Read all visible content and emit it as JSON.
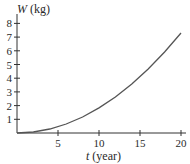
{
  "chart_data": {
    "type": "line",
    "title": "",
    "xlabel_var": "t",
    "xlabel_unit": "(year)",
    "ylabel_var": "W",
    "ylabel_unit": "(kg)",
    "x_ticks": [
      5,
      10,
      15,
      20
    ],
    "y_ticks": [
      1,
      2,
      3,
      4,
      5,
      6,
      7,
      8
    ],
    "xlim": [
      0,
      20
    ],
    "ylim": [
      0,
      8
    ],
    "grid": false,
    "legend": null,
    "series": [
      {
        "name": "W(t)",
        "x": [
          0,
          2,
          4,
          6,
          8,
          10,
          12,
          14,
          16,
          18,
          20
        ],
        "values": [
          0,
          0.07,
          0.29,
          0.66,
          1.17,
          1.83,
          2.63,
          3.58,
          4.67,
          5.91,
          7.3
        ]
      }
    ]
  }
}
